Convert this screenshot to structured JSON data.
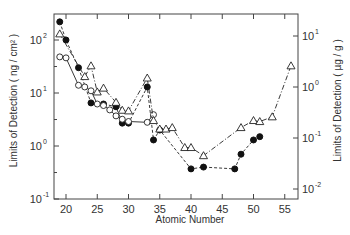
{
  "chart_data": {
    "type": "line",
    "title": "",
    "xlabel": "Atomic Number",
    "ylabel": "Limits of Detection ( ng / cm² )",
    "ylabel_right": "Limits of Detection ( µg / g )",
    "xlim": [
      18,
      57
    ],
    "ylim": [
      0.1,
      300
    ],
    "ylim_right": [
      0.01,
      20
    ],
    "yscale": "log",
    "x_ticks": [
      20,
      25,
      30,
      35,
      40,
      45,
      50,
      55
    ],
    "y_ticks_left": [
      "10^-1",
      "10^0",
      "10^1",
      "10^2"
    ],
    "y_ticks_right": [
      "10^-2",
      "10^-1",
      "10^0",
      "10^1"
    ],
    "grid": false,
    "legend": "none",
    "series": [
      {
        "name": "filled circles (dashed)",
        "axis": "left",
        "marker": "filled-circle",
        "line": "dashed",
        "x": [
          19,
          20,
          22,
          24,
          26,
          28,
          29,
          30,
          33,
          34,
          35,
          40,
          42,
          47,
          48,
          50,
          51
        ],
        "y": [
          220,
          100,
          30,
          6.5,
          6.2,
          5.5,
          2.7,
          2.7,
          13,
          1.3,
          2.0,
          0.37,
          0.4,
          0.37,
          0.7,
          1.3,
          1.5
        ]
      },
      {
        "name": "open circles (solid)",
        "axis": "left",
        "marker": "open-circle",
        "line": "solid",
        "x": [
          19,
          20,
          22,
          23,
          24,
          25,
          26,
          27,
          28,
          29,
          30,
          33,
          34
        ],
        "y": [
          48,
          46,
          14,
          13,
          11,
          6.2,
          5.8,
          4.8,
          3.7,
          3.2,
          2.9,
          2.8,
          3.9
        ]
      },
      {
        "name": "open triangles (dash-dot)",
        "axis": "right",
        "marker": "open-triangle",
        "line": "dash-dot",
        "x": [
          19,
          23,
          24,
          25,
          26,
          28,
          29,
          30,
          33,
          34,
          35,
          36,
          37,
          39,
          40,
          42,
          48,
          50,
          51,
          53,
          56
        ],
        "y": [
          11,
          1.6,
          2.6,
          0.8,
          0.95,
          0.5,
          0.35,
          0.34,
          1.5,
          0.22,
          0.15,
          0.15,
          0.16,
          0.065,
          0.065,
          0.045,
          0.16,
          0.22,
          0.21,
          0.26,
          2.6
        ]
      }
    ]
  }
}
